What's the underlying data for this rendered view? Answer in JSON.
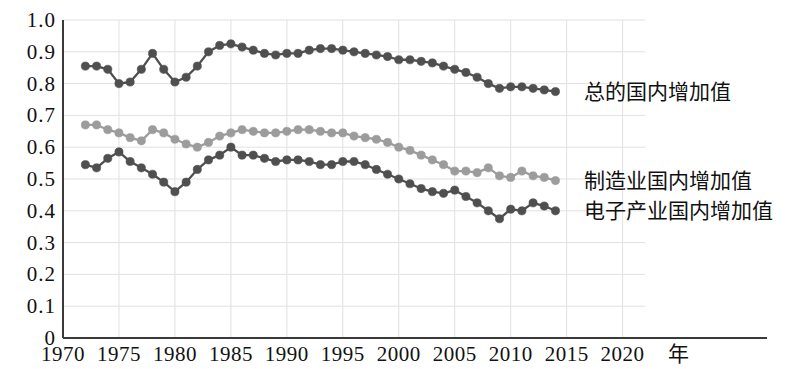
{
  "chart_data": {
    "type": "line",
    "title": "",
    "xlabel": "年",
    "ylabel": "",
    "xlim": [
      1970,
      2022
    ],
    "ylim": [
      0,
      1.0
    ],
    "grid": true,
    "legend_position": "right-inline",
    "x_ticks": [
      "1970",
      "1975",
      "1980",
      "1985",
      "1990",
      "1995",
      "2000",
      "2005",
      "2010",
      "2015",
      "2020"
    ],
    "x_tick_values": [
      1970,
      1975,
      1980,
      1985,
      1990,
      1995,
      2000,
      2005,
      2010,
      2015,
      2020
    ],
    "y_ticks": [
      "0",
      "0.1",
      "0.2",
      "0.3",
      "0.4",
      "0.5",
      "0.6",
      "0.7",
      "0.8",
      "0.9",
      "1.0"
    ],
    "y_tick_values": [
      0,
      0.1,
      0.2,
      0.3,
      0.4,
      0.5,
      0.6,
      0.7,
      0.8,
      0.9,
      1.0
    ],
    "series": [
      {
        "name": "总的国内增加值",
        "color": "#4f4f4f",
        "x": [
          1972,
          1973,
          1974,
          1975,
          1976,
          1977,
          1978,
          1979,
          1980,
          1981,
          1982,
          1983,
          1984,
          1985,
          1986,
          1987,
          1988,
          1989,
          1990,
          1991,
          1992,
          1993,
          1994,
          1995,
          1996,
          1997,
          1998,
          1999,
          2000,
          2001,
          2002,
          2003,
          2004,
          2005,
          2006,
          2007,
          2008,
          2009,
          2010,
          2011,
          2012,
          2013,
          2014
        ],
        "values": [
          0.855,
          0.855,
          0.845,
          0.8,
          0.805,
          0.845,
          0.895,
          0.845,
          0.805,
          0.82,
          0.855,
          0.9,
          0.92,
          0.925,
          0.915,
          0.905,
          0.895,
          0.89,
          0.895,
          0.895,
          0.905,
          0.91,
          0.91,
          0.905,
          0.9,
          0.895,
          0.89,
          0.885,
          0.875,
          0.875,
          0.87,
          0.865,
          0.855,
          0.845,
          0.835,
          0.82,
          0.8,
          0.785,
          0.79,
          0.79,
          0.785,
          0.78,
          0.775
        ]
      },
      {
        "name": "制造业国内增加值",
        "color": "#9c9c9c",
        "x": [
          1972,
          1973,
          1974,
          1975,
          1976,
          1977,
          1978,
          1979,
          1980,
          1981,
          1982,
          1983,
          1984,
          1985,
          1986,
          1987,
          1988,
          1989,
          1990,
          1991,
          1992,
          1993,
          1994,
          1995,
          1996,
          1997,
          1998,
          1999,
          2000,
          2001,
          2002,
          2003,
          2004,
          2005,
          2006,
          2007,
          2008,
          2009,
          2010,
          2011,
          2012,
          2013,
          2014
        ],
        "values": [
          0.67,
          0.67,
          0.655,
          0.645,
          0.63,
          0.62,
          0.655,
          0.645,
          0.625,
          0.61,
          0.6,
          0.615,
          0.635,
          0.645,
          0.655,
          0.65,
          0.645,
          0.645,
          0.65,
          0.655,
          0.655,
          0.65,
          0.645,
          0.645,
          0.635,
          0.63,
          0.625,
          0.615,
          0.6,
          0.59,
          0.575,
          0.56,
          0.545,
          0.525,
          0.525,
          0.52,
          0.535,
          0.51,
          0.505,
          0.525,
          0.51,
          0.505,
          0.495
        ]
      },
      {
        "name": "电子产业国内增加值",
        "color": "#4f4f4f",
        "x": [
          1972,
          1973,
          1974,
          1975,
          1976,
          1977,
          1978,
          1979,
          1980,
          1981,
          1982,
          1983,
          1984,
          1985,
          1986,
          1987,
          1988,
          1989,
          1990,
          1991,
          1992,
          1993,
          1994,
          1995,
          1996,
          1997,
          1998,
          1999,
          2000,
          2001,
          2002,
          2003,
          2004,
          2005,
          2006,
          2007,
          2008,
          2009,
          2010,
          2011,
          2012,
          2013,
          2014
        ],
        "values": [
          0.545,
          0.535,
          0.565,
          0.585,
          0.555,
          0.535,
          0.515,
          0.49,
          0.46,
          0.49,
          0.53,
          0.56,
          0.575,
          0.6,
          0.575,
          0.575,
          0.565,
          0.555,
          0.56,
          0.56,
          0.555,
          0.545,
          0.545,
          0.555,
          0.555,
          0.545,
          0.53,
          0.515,
          0.5,
          0.485,
          0.47,
          0.46,
          0.455,
          0.465,
          0.445,
          0.425,
          0.4,
          0.375,
          0.405,
          0.4,
          0.425,
          0.415,
          0.4
        ]
      }
    ]
  },
  "legend": {
    "items": [
      {
        "label": "总的国内增加值"
      },
      {
        "label": "制造业国内增加值"
      },
      {
        "label": "电子产业国内增加值"
      }
    ]
  },
  "axis_unit_label": "年"
}
